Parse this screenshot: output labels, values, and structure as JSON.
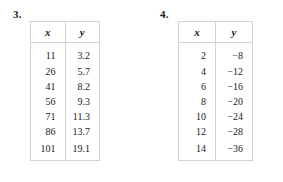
{
  "page": {
    "background_color": "#ffffff",
    "text_color": "#1a1a1a",
    "border_color": "#d2d2d2"
  },
  "problems": [
    {
      "number": "3.",
      "columns": [
        "x",
        "y"
      ],
      "rows": [
        [
          "11",
          "3.2"
        ],
        [
          "26",
          "5.7"
        ],
        [
          "41",
          "8.2"
        ],
        [
          "56",
          "9.3"
        ],
        [
          "71",
          "11.3"
        ],
        [
          "86",
          "13.7"
        ],
        [
          "101",
          "19.1"
        ]
      ]
    },
    {
      "number": "4.",
      "columns": [
        "x",
        "y"
      ],
      "rows": [
        [
          "2",
          "−8"
        ],
        [
          "4",
          "−12"
        ],
        [
          "6",
          "−16"
        ],
        [
          "8",
          "−20"
        ],
        [
          "10",
          "−24"
        ],
        [
          "12",
          "−28"
        ],
        [
          "14",
          "−36"
        ]
      ]
    }
  ],
  "chart_data": {
    "type": "table",
    "title": "",
    "tables": [
      {
        "label": "3.",
        "xlabel": "x",
        "ylabel": "y",
        "x": [
          11,
          26,
          41,
          56,
          71,
          86,
          101
        ],
        "y": [
          3.2,
          5.7,
          8.2,
          9.3,
          11.3,
          13.7,
          19.1
        ]
      },
      {
        "label": "4.",
        "xlabel": "x",
        "ylabel": "y",
        "x": [
          2,
          4,
          6,
          8,
          10,
          12,
          14
        ],
        "y": [
          -8,
          -12,
          -16,
          -20,
          -24,
          -28,
          -36
        ]
      }
    ]
  }
}
